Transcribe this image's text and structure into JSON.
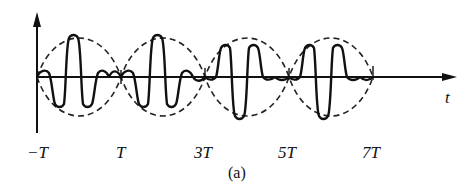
{
  "figure": {
    "caption": "(a)",
    "x_axis_label": "t",
    "tick_labels": [
      "−T",
      "T",
      "3T",
      "5T",
      "7T"
    ],
    "colors": {
      "line": "#111111",
      "background": "#ffffff"
    }
  },
  "diagram": {
    "type": "waveform",
    "envelope": {
      "style": "dashed",
      "nodes": [
        "−T",
        "T",
        "3T",
        "5T",
        "7T"
      ]
    },
    "signal": {
      "style": "solid"
    }
  }
}
